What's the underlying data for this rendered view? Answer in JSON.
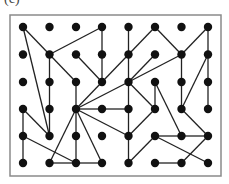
{
  "figure": {
    "label": "(c)",
    "frame": {
      "x": 10,
      "y": 15,
      "width": 211,
      "height": 161,
      "stroke": "#8a8a8a"
    },
    "grid": {
      "cols": 8,
      "rows": 6,
      "col_x": [
        23,
        49.5,
        76,
        102,
        128.5,
        155,
        181.5,
        208
      ],
      "row_y": [
        27,
        54.5,
        82,
        109,
        136,
        163
      ]
    },
    "node_color": "#111111",
    "edge_color": "#222222",
    "edges": [
      [
        [
          0,
          0
        ],
        [
          1,
          1
        ]
      ],
      [
        [
          0,
          0
        ],
        [
          1,
          4
        ]
      ],
      [
        [
          1,
          1
        ],
        [
          3,
          0
        ]
      ],
      [
        [
          1,
          1
        ],
        [
          1,
          2
        ]
      ],
      [
        [
          1,
          1
        ],
        [
          2,
          2
        ]
      ],
      [
        [
          1,
          2
        ],
        [
          1,
          3
        ]
      ],
      [
        [
          1,
          3
        ],
        [
          1,
          4
        ]
      ],
      [
        [
          0,
          3
        ],
        [
          1,
          4
        ]
      ],
      [
        [
          0,
          3
        ],
        [
          0,
          4
        ]
      ],
      [
        [
          0,
          4
        ],
        [
          0,
          5
        ]
      ],
      [
        [
          0,
          4
        ],
        [
          2,
          5
        ]
      ],
      [
        [
          2,
          1
        ],
        [
          3,
          2
        ]
      ],
      [
        [
          3,
          0
        ],
        [
          3,
          1
        ]
      ],
      [
        [
          3,
          1
        ],
        [
          3,
          2
        ]
      ],
      [
        [
          2,
          2
        ],
        [
          2,
          3
        ]
      ],
      [
        [
          2,
          3
        ],
        [
          3,
          2
        ]
      ],
      [
        [
          2,
          3
        ],
        [
          4,
          2
        ]
      ],
      [
        [
          2,
          3
        ],
        [
          3,
          3
        ]
      ],
      [
        [
          3,
          3
        ],
        [
          4,
          3
        ]
      ],
      [
        [
          2,
          3
        ],
        [
          4,
          4
        ]
      ],
      [
        [
          2,
          3
        ],
        [
          2,
          4
        ]
      ],
      [
        [
          2,
          4
        ],
        [
          2,
          5
        ]
      ],
      [
        [
          2,
          3
        ],
        [
          1,
          5
        ]
      ],
      [
        [
          2,
          3
        ],
        [
          3,
          5
        ]
      ],
      [
        [
          1,
          5
        ],
        [
          2,
          5
        ]
      ],
      [
        [
          2,
          5
        ],
        [
          3,
          5
        ]
      ],
      [
        [
          4,
          0
        ],
        [
          4,
          1
        ]
      ],
      [
        [
          4,
          1
        ],
        [
          4,
          2
        ]
      ],
      [
        [
          5,
          0
        ],
        [
          4,
          1
        ]
      ],
      [
        [
          4,
          1
        ],
        [
          3,
          2
        ]
      ],
      [
        [
          4,
          2
        ],
        [
          5,
          1
        ]
      ],
      [
        [
          4,
          2
        ],
        [
          6,
          1
        ]
      ],
      [
        [
          4,
          2
        ],
        [
          4,
          3
        ]
      ],
      [
        [
          4,
          3
        ],
        [
          4,
          4
        ]
      ],
      [
        [
          4,
          2
        ],
        [
          5,
          3
        ]
      ],
      [
        [
          5,
          0
        ],
        [
          6,
          1
        ]
      ],
      [
        [
          6,
          1
        ],
        [
          7,
          0
        ]
      ],
      [
        [
          7,
          0
        ],
        [
          7,
          1
        ]
      ],
      [
        [
          6,
          1
        ],
        [
          6,
          2
        ]
      ],
      [
        [
          7,
          1
        ],
        [
          7,
          2
        ]
      ],
      [
        [
          7,
          1
        ],
        [
          6,
          3
        ]
      ],
      [
        [
          6,
          2
        ],
        [
          6,
          3
        ]
      ],
      [
        [
          7,
          2
        ],
        [
          7,
          3
        ]
      ],
      [
        [
          5,
          2
        ],
        [
          5,
          3
        ]
      ],
      [
        [
          5,
          2
        ],
        [
          6,
          4
        ]
      ],
      [
        [
          5,
          3
        ],
        [
          4,
          4
        ]
      ],
      [
        [
          6,
          3
        ],
        [
          7,
          4
        ]
      ],
      [
        [
          5,
          4
        ],
        [
          6,
          4
        ]
      ],
      [
        [
          6,
          4
        ],
        [
          7,
          4
        ]
      ],
      [
        [
          4,
          4
        ],
        [
          4,
          5
        ]
      ],
      [
        [
          5,
          4
        ],
        [
          4,
          5
        ]
      ],
      [
        [
          5,
          4
        ],
        [
          7,
          5
        ]
      ],
      [
        [
          5,
          5
        ],
        [
          6,
          5
        ]
      ],
      [
        [
          6,
          5
        ],
        [
          7,
          4
        ]
      ]
    ]
  }
}
